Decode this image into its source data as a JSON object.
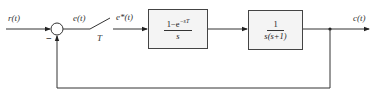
{
  "diagram": {
    "type": "sampled-data control system block diagram",
    "signals": {
      "input": "r(t)",
      "error": "e(t)",
      "sampled_error": "e*(t)",
      "output": "c(t)"
    },
    "sampler": {
      "label": "T"
    },
    "summing_junction": {
      "feedback_sign": "−"
    },
    "blocks": [
      {
        "id": "zoh",
        "numerator": "1−e",
        "numerator_exp": "−sT",
        "denominator": "s"
      },
      {
        "id": "plant",
        "numerator": "1",
        "denominator": "s(s+1)"
      }
    ],
    "feedback": "unity negative feedback from c(t) to summing junction"
  }
}
